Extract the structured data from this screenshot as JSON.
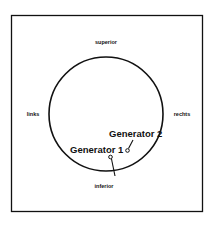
{
  "diagram": {
    "orientation_labels": {
      "top": "superior",
      "left": "links",
      "right": "rechts",
      "bottom": "inferior"
    },
    "generators": [
      {
        "label": "Generator 1"
      },
      {
        "label": "Generator 2"
      }
    ],
    "colors": {
      "stroke": "#111111",
      "background": "#ffffff"
    }
  }
}
